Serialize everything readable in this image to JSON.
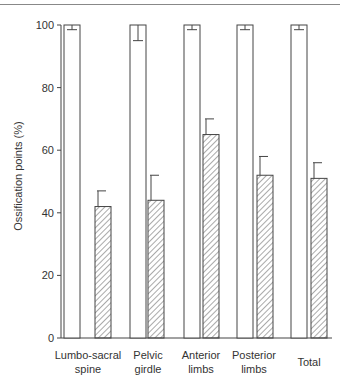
{
  "chart_data": {
    "type": "bar",
    "title": "",
    "xlabel": "",
    "ylabel": "Ossification points (%)",
    "ylim": [
      0,
      100
    ],
    "yticks": [
      0,
      20,
      40,
      60,
      80,
      100
    ],
    "grid": false,
    "legend": null,
    "categories": [
      "Lumbo-sacral spine",
      "Pelvic girdle",
      "Anterior limbs",
      "Posterior limbs",
      "Total"
    ],
    "category_lines": [
      [
        "Lumbo-sacral",
        "spine"
      ],
      [
        "Pelvic",
        "girdle"
      ],
      [
        "Anterior",
        "limbs"
      ],
      [
        "Posterior",
        "limbs"
      ],
      [
        "Total",
        ""
      ]
    ],
    "series": [
      {
        "name": "Open bars",
        "style": "open",
        "values": [
          100,
          100,
          100,
          100,
          100
        ],
        "error_low": [
          98.5,
          95,
          98.5,
          98.5,
          98.5
        ]
      },
      {
        "name": "Hatched bars",
        "style": "hatched",
        "values": [
          42,
          44,
          65,
          52,
          51
        ],
        "error_high": [
          47,
          52,
          70,
          58,
          56
        ]
      }
    ]
  },
  "axis": {
    "ylabel": "Ossification points (%)",
    "ticks": [
      "0",
      "20",
      "40",
      "60",
      "80",
      "100"
    ]
  }
}
